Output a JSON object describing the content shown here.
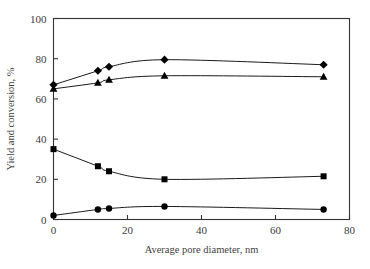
{
  "chart_data": {
    "type": "scatter",
    "title": "",
    "xlabel": "Average pore diameter, nm",
    "ylabel": "Yield and conversion, %",
    "xlim": [
      0,
      80
    ],
    "ylim": [
      0,
      100
    ],
    "xticks": [
      0,
      20,
      40,
      60,
      80
    ],
    "yticks": [
      0,
      20,
      40,
      60,
      80,
      100
    ],
    "grid": false,
    "legend": "none",
    "frame": "box",
    "color": "#000000",
    "x": [
      0,
      12,
      15,
      30,
      73
    ],
    "series": [
      {
        "name": "diamond-series",
        "marker": "diamond",
        "values": [
          67,
          74,
          76,
          79.5,
          77
        ]
      },
      {
        "name": "triangle-series",
        "marker": "triangle",
        "values": [
          65,
          68,
          69.5,
          71.5,
          71
        ]
      },
      {
        "name": "square-series",
        "marker": "square",
        "values": [
          35,
          26.5,
          24,
          20,
          21.5
        ]
      },
      {
        "name": "circle-series",
        "marker": "circle",
        "values": [
          2,
          5,
          5.5,
          6.5,
          5
        ]
      }
    ]
  },
  "axes": {
    "x_tick_labels": [
      "0",
      "20",
      "40",
      "60",
      "80"
    ],
    "y_tick_labels": [
      "0",
      "20",
      "40",
      "60",
      "80",
      "100"
    ],
    "x_title": "Average pore diameter, nm",
    "y_title": "Yield and conversion, %"
  }
}
